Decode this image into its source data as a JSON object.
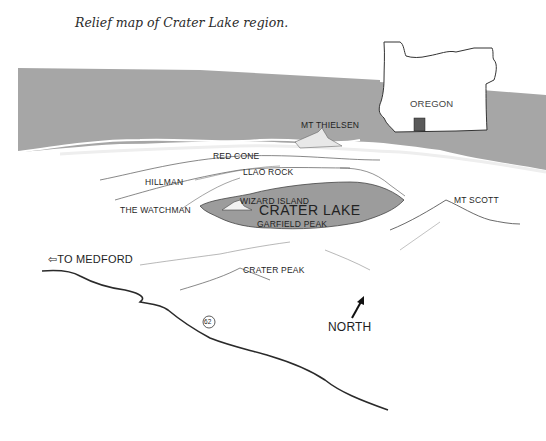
{
  "caption": "Relief map of Crater Lake region.",
  "inset": {
    "state_label": "OREGON",
    "locator_color": "#5a5a5a"
  },
  "labels": {
    "mt_thielsen": "MT THIELSEN",
    "red_cone": "RED CONE",
    "llao_rock": "LLAO ROCK",
    "hillman": "HILLMAN",
    "the_watchman": "THE WATCHMAN",
    "wizard_island": "WIZARD ISLAND",
    "crater_lake": "CRATER LAKE",
    "garfield_peak": "GARFIELD PEAK",
    "mt_scott": "MT SCOTT",
    "to_medford": "TO MEDFORD",
    "crater_peak": "CRATER PEAK",
    "route_number": "62",
    "north": "NORTH"
  },
  "icons": {
    "left_arrow": "⇦",
    "north_arrow": "north-arrow"
  },
  "colors": {
    "background_band": "#a6a6a6",
    "lake": "#9c9c9c",
    "line": "#333333"
  }
}
